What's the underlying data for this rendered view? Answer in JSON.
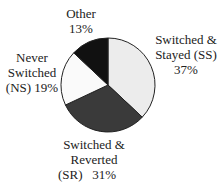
{
  "chart_data": {
    "type": "pie",
    "title": "",
    "slices": [
      {
        "label": "Switched & Stayed (SS)",
        "value": 37,
        "color": "#ececec"
      },
      {
        "label": "Switched & Reverted (SR)",
        "value": 31,
        "color": "#3a3a3a"
      },
      {
        "label": "Never Switched (NS)",
        "value": 19,
        "color": "#fafafa"
      },
      {
        "label": "Other",
        "value": 13,
        "color": "#111111"
      }
    ]
  },
  "labels": {
    "ss_line1": "Switched &",
    "ss_line2": "Stayed (SS)",
    "ss_pct": "37%",
    "sr_line1": "Switched &",
    "sr_line2": "Reverted",
    "sr_line3": "(SR)   31%",
    "ns_line1": "Never",
    "ns_line2": "Switched",
    "ns_line3": "(NS) 19%",
    "other_line1": "Other",
    "other_pct": "13%"
  }
}
